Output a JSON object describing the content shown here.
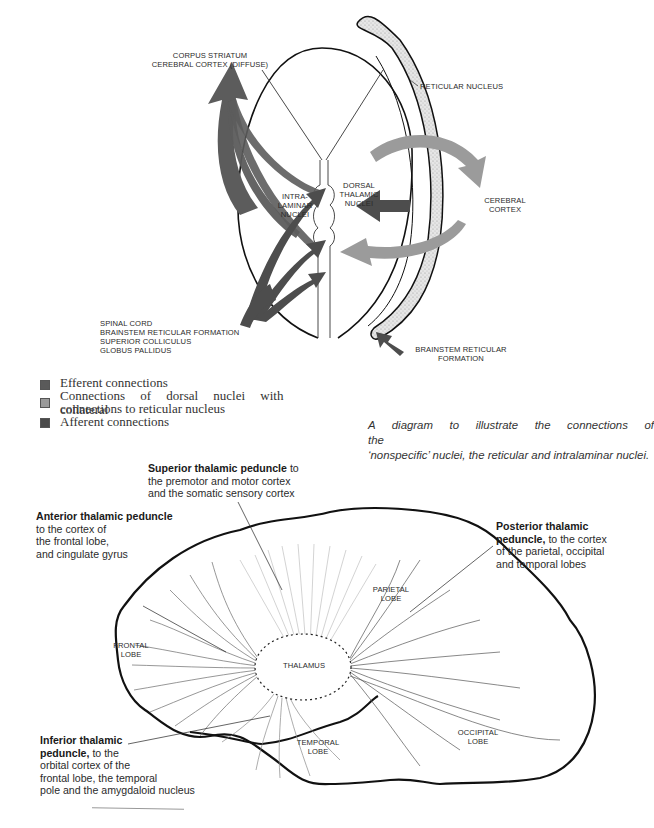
{
  "figure1": {
    "labels": {
      "efferent_target_line1": "CORPUS STRIATUM",
      "efferent_target_line2": "CEREBRAL CORTEX (DIFFUSE)",
      "reticular_nucleus": "RETICULAR NUCLEUS",
      "intralaminar_line1": "INTRA-",
      "intralaminar_line2": "LAMINAR",
      "intralaminar_line3": "NUCLEI",
      "dorsal_line1": "DORSAL",
      "dorsal_line2": "THALAMIC",
      "dorsal_line3": "NUCLEI",
      "cortex_line1": "CEREBRAL",
      "cortex_line2": "CORTEX",
      "afferent_src1": "SPINAL CORD",
      "afferent_src2": "BRAINSTEM RETICULAR FORMATION",
      "afferent_src3": "SUPERIOR COLLICULUS",
      "afferent_src4": "GLOBUS PALLIDUS",
      "brainstem_line1": "BRAINSTEM RETICULAR",
      "brainstem_line2": "FORMATION"
    },
    "legend": [
      {
        "label": "Efferent connections",
        "color": "#5a5a5a"
      },
      {
        "label_line1": "Connections of dorsal nuclei with collateral",
        "label_line2": "connections to reticular nucleus",
        "color": "#9a9a9a"
      },
      {
        "label": "Afferent connections",
        "color": "#4a4a4a"
      }
    ],
    "caption_line1": "A diagram to illustrate the connections of the",
    "caption_line2": "‘nonspecific’ nuclei, the reticular and intralaminar nuclei.",
    "colors": {
      "efferent": "#5c5c5c",
      "dorsal": "#9b9b9b",
      "afferent": "#4d4d4d",
      "outline": "#111111"
    }
  },
  "figure2": {
    "annotations": {
      "superior_bold": "Superior thalamic peduncle",
      "superior_rest1": " to",
      "superior_rest2": "the premotor and motor cortex",
      "superior_rest3": "and the somatic sensory cortex",
      "anterior_bold": "Anterior thalamic peduncle",
      "anterior_rest1": "to the cortex of",
      "anterior_rest2": "the frontal lobe,",
      "anterior_rest3": "and cingulate gyrus",
      "posterior_bold1": "Posterior thalamic",
      "posterior_bold2": "peduncle,",
      "posterior_rest1": " to the cortex",
      "posterior_rest2": "of the parietal, occipital",
      "posterior_rest3": "and temporal lobes",
      "inferior_bold1": "Inferior thalamic",
      "inferior_bold2": "peduncle,",
      "inferior_rest1": " to the",
      "inferior_rest2": "orbital cortex of the",
      "inferior_rest3": "frontal lobe, the temporal",
      "inferior_rest4": "pole and the amygdaloid nucleus"
    },
    "lobes": {
      "parietal_line1": "PARIETAL",
      "parietal_line2": "LOBE",
      "frontal_line1": "FRONTAL",
      "frontal_line2": "LOBE",
      "thalamus": "THALAMUS",
      "temporal_line1": "TEMPORAL",
      "temporal_line2": "LOBE",
      "occipital_line1": "OCCIPITAL",
      "occipital_line2": "LOBE"
    }
  }
}
